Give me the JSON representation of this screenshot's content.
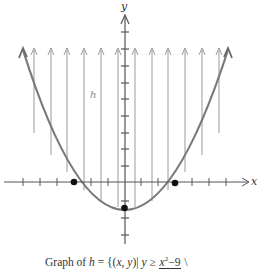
{
  "figure": {
    "y_axis_label": "y",
    "x_axis_label": "x",
    "region_label": "h",
    "caption": {
      "prefix": "Graph of ",
      "set_name": "h",
      "equals": " = {(",
      "vars": "x, y",
      "bar": ")| ",
      "var_y": "y",
      "relation": " ≥ ",
      "numerator": "x",
      "exponent": "2",
      "numerator_rest": "−9",
      "trailing": " \\"
    },
    "marked_points": [
      {
        "label": "x-intercept-left",
        "x": -3,
        "y": 0
      },
      {
        "label": "x-intercept-right",
        "x": 3,
        "y": 0
      },
      {
        "label": "vertex",
        "x": 0,
        "y": -1.5
      }
    ],
    "colors": {
      "curve": "#7a7a7a",
      "axes": "#555555",
      "shading_lines": "#9a9a9a",
      "points": "#111111"
    }
  }
}
